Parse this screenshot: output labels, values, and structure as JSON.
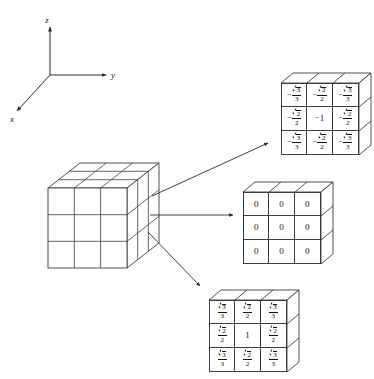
{
  "figure": {
    "background_color": "#ffffff",
    "line_color": "#3c3c3c",
    "text_color": "#111111"
  },
  "axes": {
    "name": "coordinate-axes",
    "z_label": "z",
    "y_label": "y",
    "x_label": "x"
  },
  "source_cube": {
    "name": "source-cube",
    "rows": 3,
    "columns": 3,
    "layers": 3
  },
  "arrows": [
    {
      "name": "arrow-to-top-layer",
      "target": "top-layer"
    },
    {
      "name": "arrow-to-middle-layer",
      "target": "middle-layer"
    },
    {
      "name": "arrow-to-bottom-layer",
      "target": "bottom-layer"
    }
  ],
  "layers": [
    {
      "id": "top-layer",
      "name": "top-layer-slab",
      "sign": "negative",
      "cells": [
        [
          {
            "sign": "−",
            "type": "fraction",
            "num_radical": "3",
            "den": "3"
          },
          {
            "sign": "−",
            "type": "fraction",
            "num_radical": "2",
            "den": "2"
          },
          {
            "sign": "−",
            "type": "fraction",
            "num_radical": "3",
            "den": "3"
          }
        ],
        [
          {
            "sign": "−",
            "type": "fraction",
            "num_radical": "2",
            "den": "2"
          },
          {
            "sign": "−",
            "type": "whole",
            "value": "1"
          },
          {
            "sign": "−",
            "type": "fraction",
            "num_radical": "2",
            "den": "2"
          }
        ],
        [
          {
            "sign": "−",
            "type": "fraction",
            "num_radical": "3",
            "den": "3"
          },
          {
            "sign": "−",
            "type": "fraction",
            "num_radical": "2",
            "den": "2"
          },
          {
            "sign": "−",
            "type": "fraction",
            "num_radical": "3",
            "den": "3"
          }
        ]
      ]
    },
    {
      "id": "middle-layer",
      "name": "middle-layer-slab",
      "sign": "zero",
      "cells": [
        [
          {
            "sign": "",
            "type": "whole",
            "value": "0"
          },
          {
            "sign": "",
            "type": "whole",
            "value": "0"
          },
          {
            "sign": "",
            "type": "whole",
            "value": "0"
          }
        ],
        [
          {
            "sign": "",
            "type": "whole",
            "value": "0"
          },
          {
            "sign": "",
            "type": "whole",
            "value": "0"
          },
          {
            "sign": "",
            "type": "whole",
            "value": "0"
          }
        ],
        [
          {
            "sign": "",
            "type": "whole",
            "value": "0"
          },
          {
            "sign": "",
            "type": "whole",
            "value": "0"
          },
          {
            "sign": "",
            "type": "whole",
            "value": "0"
          }
        ]
      ]
    },
    {
      "id": "bottom-layer",
      "name": "bottom-layer-slab",
      "sign": "positive",
      "cells": [
        [
          {
            "sign": "",
            "type": "fraction",
            "num_radical": "3",
            "den": "3"
          },
          {
            "sign": "",
            "type": "fraction",
            "num_radical": "2",
            "den": "2"
          },
          {
            "sign": "",
            "type": "fraction",
            "num_radical": "3",
            "den": "3"
          }
        ],
        [
          {
            "sign": "",
            "type": "fraction",
            "num_radical": "2",
            "den": "2"
          },
          {
            "sign": "",
            "type": "whole",
            "value": "1"
          },
          {
            "sign": "",
            "type": "fraction",
            "num_radical": "2",
            "den": "2"
          }
        ],
        [
          {
            "sign": "",
            "type": "fraction",
            "num_radical": "3",
            "den": "3"
          },
          {
            "sign": "",
            "type": "fraction",
            "num_radical": "2",
            "den": "2"
          },
          {
            "sign": "",
            "type": "fraction",
            "num_radical": "3",
            "den": "3"
          }
        ]
      ]
    }
  ]
}
